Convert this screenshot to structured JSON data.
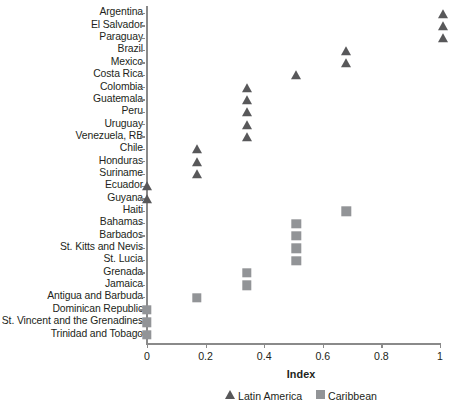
{
  "chart_data": {
    "type": "scatter",
    "title": "",
    "subtitle": "",
    "xlabel": "Index",
    "ylabel": "",
    "xlim": [
      0,
      1
    ],
    "xticks": [
      0,
      0.2,
      0.4,
      0.6,
      0.8,
      1
    ],
    "xticklabels": [
      "0",
      "0.2",
      "0.4",
      "0.6",
      "0.8",
      "1"
    ],
    "grid": false,
    "legend_position": "bottom",
    "categories": [
      "Argentina",
      "El Salvador",
      "Paraguay",
      "Brazil",
      "Mexico",
      "Costa Rica",
      "Colombia",
      "Guatemala",
      "Peru",
      "Uruguay",
      "Venezuela, RB",
      "Chile",
      "Honduras",
      "Suriname",
      "Ecuador",
      "Guyana",
      "Haiti",
      "Bahamas",
      "Barbados",
      "St. Kitts and Nevis",
      "St. Lucia",
      "Grenada",
      "Jamaica",
      "Antigua and Barbuda",
      "Dominican Republic",
      "St. Vincent and the Grenadines",
      "Trinidad and Tobago"
    ],
    "series": [
      {
        "name": "Latin America",
        "marker": "triangle",
        "color": "#58585a",
        "points": [
          {
            "category": "Argentina",
            "value": 1.01
          },
          {
            "category": "El Salvador",
            "value": 1.01
          },
          {
            "category": "Paraguay",
            "value": 1.01
          },
          {
            "category": "Brazil",
            "value": 0.68
          },
          {
            "category": "Mexico",
            "value": 0.68
          },
          {
            "category": "Costa Rica",
            "value": 0.51
          },
          {
            "category": "Colombia",
            "value": 0.34
          },
          {
            "category": "Guatemala",
            "value": 0.34
          },
          {
            "category": "Peru",
            "value": 0.34
          },
          {
            "category": "Uruguay",
            "value": 0.34
          },
          {
            "category": "Venezuela, RB",
            "value": 0.34
          },
          {
            "category": "Chile",
            "value": 0.17
          },
          {
            "category": "Honduras",
            "value": 0.17
          },
          {
            "category": "Suriname",
            "value": 0.17
          },
          {
            "category": "Ecuador",
            "value": 0.0
          },
          {
            "category": "Guyana",
            "value": 0.0
          }
        ]
      },
      {
        "name": "Caribbean",
        "marker": "square",
        "color": "#929497",
        "points": [
          {
            "category": "Haiti",
            "value": 0.68
          },
          {
            "category": "Bahamas",
            "value": 0.51
          },
          {
            "category": "Barbados",
            "value": 0.51
          },
          {
            "category": "St. Kitts and Nevis",
            "value": 0.51
          },
          {
            "category": "St. Lucia",
            "value": 0.51
          },
          {
            "category": "Grenada",
            "value": 0.34
          },
          {
            "category": "Jamaica",
            "value": 0.34
          },
          {
            "category": "Antigua and Barbuda",
            "value": 0.17
          },
          {
            "category": "Dominican Republic",
            "value": 0.0
          },
          {
            "category": "St. Vincent and the Grenadines",
            "value": 0.0
          },
          {
            "category": "Trinidad and Tobago",
            "value": 0.0
          }
        ]
      }
    ]
  },
  "legend": [
    {
      "label": "Latin America",
      "marker": "triangle"
    },
    {
      "label": "Caribbean",
      "marker": "square"
    }
  ],
  "axis": {
    "x_title": "Index"
  }
}
